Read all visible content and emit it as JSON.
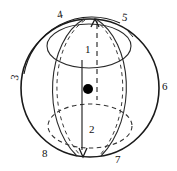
{
  "figure": {
    "type": "sphere-diagram",
    "background_color": "#ffffff",
    "stroke_color": "#1a1a1a",
    "dashed_stroke_color": "#333333",
    "marker_color": "#000000",
    "sphere": {
      "center_x": 90,
      "center_y": 88,
      "radius": 69,
      "outline_style": "solid"
    },
    "axis": {
      "top_arrow": "up-arrowhead",
      "bottom_arrow": "down-arrowhead",
      "solid_line_x": 82,
      "dashed_line_x": 97
    },
    "center_marker": {
      "x": 88,
      "y": 89,
      "radius": 5,
      "shape": "filled-circle"
    },
    "upper_ring": {
      "cx": 89,
      "cy": 46,
      "rx": 42,
      "ry": 22,
      "style": "solid"
    },
    "lower_ring": {
      "cx": 90,
      "cy": 126,
      "rx": 42,
      "ry": 22,
      "style": "dashed"
    }
  },
  "labels": [
    {
      "id": "label-1",
      "text": "1",
      "x": 85,
      "y": 44,
      "rotation": 0
    },
    {
      "id": "label-2",
      "text": "2",
      "x": 89,
      "y": 124,
      "rotation": 0
    },
    {
      "id": "label-3",
      "text": "3",
      "x": 12,
      "y": 72,
      "rotation": -80
    },
    {
      "id": "label-4",
      "text": "4",
      "x": 57,
      "y": 9,
      "rotation": -10
    },
    {
      "id": "label-5",
      "text": "5",
      "x": 122,
      "y": 12,
      "rotation": 8
    },
    {
      "id": "label-6",
      "text": "6",
      "x": 162,
      "y": 81,
      "rotation": 0
    },
    {
      "id": "label-7",
      "text": "7",
      "x": 115,
      "y": 154,
      "rotation": 0
    },
    {
      "id": "label-8",
      "text": "8",
      "x": 42,
      "y": 148,
      "rotation": 0
    }
  ]
}
